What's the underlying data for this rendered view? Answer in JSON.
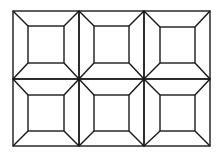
{
  "figure": {
    "stroke_color": "#1a1a1a",
    "background": "#ffffff",
    "outer": {
      "x1": 13,
      "y1": 11,
      "x2": 210,
      "y2": 146
    },
    "columns": [
      13,
      79,
      144,
      210
    ],
    "rows": [
      11,
      79,
      146
    ],
    "cells": [
      {
        "outer": [
          13,
          11,
          79,
          79
        ],
        "inner": [
          28,
          26,
          64,
          63
        ]
      },
      {
        "outer": [
          79,
          11,
          144,
          79
        ],
        "inner": [
          94,
          26,
          129,
          63
        ]
      },
      {
        "outer": [
          144,
          11,
          210,
          79
        ],
        "inner": [
          160,
          27,
          195,
          63
        ]
      },
      {
        "outer": [
          13,
          79,
          79,
          146
        ],
        "inner": [
          28,
          95,
          64,
          131
        ]
      },
      {
        "outer": [
          79,
          79,
          144,
          146
        ],
        "inner": [
          94,
          95,
          129,
          131
        ]
      },
      {
        "outer": [
          144,
          79,
          210,
          146
        ],
        "inner": [
          160,
          95,
          195,
          131
        ]
      }
    ]
  }
}
